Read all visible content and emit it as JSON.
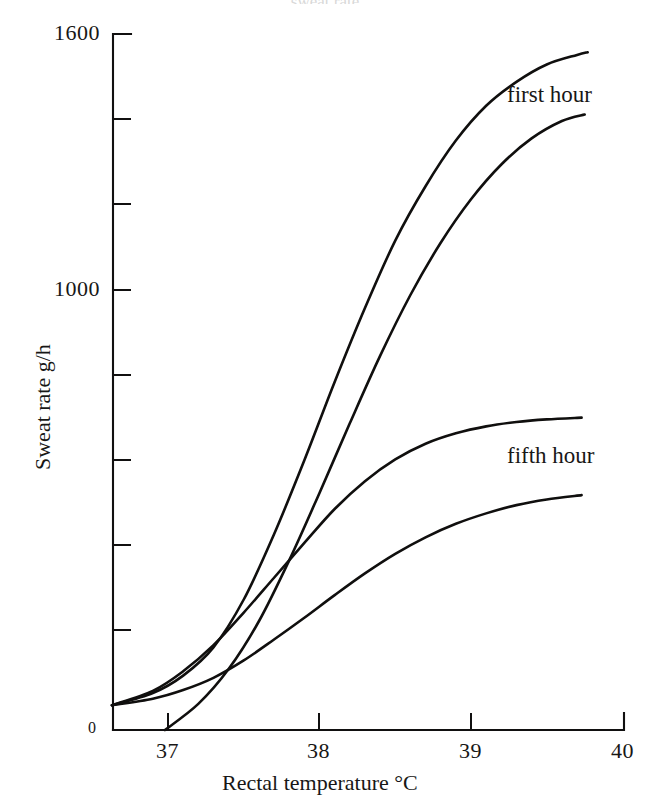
{
  "figure": {
    "background_color": "#ffffff",
    "ink_color": "#111010",
    "cropped_top_text": "sweat rate"
  },
  "chart_data": {
    "type": "line",
    "title": "",
    "xlabel": "Rectal temperature °C",
    "ylabel": "Sweat rate g/h",
    "xlim": [
      36.63,
      40.0
    ],
    "ylim": [
      0,
      1600
    ],
    "xticks": [
      37,
      38,
      39,
      40
    ],
    "xtick_labels": [
      "37",
      "38",
      "39",
      "40"
    ],
    "yticks": [
      0,
      200,
      400,
      600,
      800,
      1000,
      1200,
      1400,
      1600
    ],
    "ytick_labels_shown": {
      "0": "0",
      "1000": "1000",
      "1600": "1600"
    },
    "grid": false,
    "legend_position": "inline-annotations",
    "annotations": [
      {
        "text": "first hour",
        "x": 39.2,
        "y": 1470
      },
      {
        "text": "fifth hour",
        "x": 39.2,
        "y": 740
      }
    ],
    "series": [
      {
        "name": "first hour (upper)",
        "label_group": "first hour",
        "x": [
          36.63,
          36.9,
          37.1,
          37.3,
          37.5,
          37.7,
          37.9,
          38.1,
          38.3,
          38.5,
          38.7,
          38.9,
          39.1,
          39.3,
          39.5,
          39.7,
          39.77
        ],
        "y": [
          57,
          85,
          125,
          190,
          300,
          450,
          620,
          800,
          970,
          1125,
          1250,
          1355,
          1435,
          1490,
          1530,
          1552,
          1558
        ]
      },
      {
        "name": "first hour (lower)",
        "label_group": "first hour",
        "x": [
          36.98,
          37.2,
          37.4,
          37.6,
          37.8,
          38.0,
          38.2,
          38.4,
          38.6,
          38.8,
          39.0,
          39.2,
          39.4,
          39.6,
          39.75
        ],
        "y": [
          0,
          60,
          140,
          250,
          390,
          545,
          705,
          860,
          1000,
          1120,
          1220,
          1300,
          1360,
          1400,
          1415
        ]
      },
      {
        "name": "fifth hour (upper)",
        "label_group": "fifth hour",
        "x": [
          36.63,
          36.9,
          37.1,
          37.3,
          37.5,
          37.7,
          37.9,
          38.1,
          38.3,
          38.5,
          38.7,
          38.9,
          39.1,
          39.3,
          39.5,
          39.73
        ],
        "y": [
          57,
          90,
          135,
          195,
          270,
          350,
          430,
          508,
          572,
          622,
          658,
          682,
          698,
          708,
          714,
          718
        ]
      },
      {
        "name": "fifth hour (lower)",
        "label_group": "fifth hour",
        "x": [
          36.63,
          36.9,
          37.1,
          37.3,
          37.5,
          37.7,
          37.9,
          38.1,
          38.3,
          38.5,
          38.7,
          38.9,
          39.1,
          39.3,
          39.5,
          39.73
        ],
        "y": [
          57,
          72,
          92,
          120,
          160,
          208,
          258,
          310,
          360,
          405,
          443,
          474,
          498,
          517,
          530,
          540
        ]
      }
    ]
  },
  "axes": {
    "y_label_1600": "1600",
    "y_label_1000": "1000",
    "y_label_0": "0",
    "x_label_37": "37",
    "x_label_38": "38",
    "x_label_39": "39",
    "x_label_40": "40",
    "x_axis_title": "Rectal temperature °C",
    "y_axis_title": "Sweat rate g/h"
  },
  "series_labels": {
    "first_hour": "first hour",
    "fifth_hour": "fifth hour"
  }
}
